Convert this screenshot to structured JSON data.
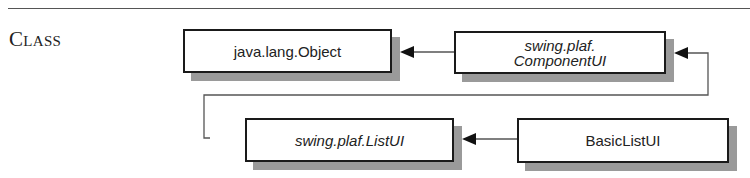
{
  "section": {
    "label": "Class"
  },
  "diagram": {
    "nodes": [
      {
        "id": "object",
        "label": "java.lang.Object",
        "abstract": false
      },
      {
        "id": "componentui",
        "label_line1": "swing.plaf.",
        "label_line2": "ComponentUI",
        "abstract": true
      },
      {
        "id": "listui",
        "label": "swing.plaf.ListUI",
        "abstract": true
      },
      {
        "id": "basiclistui",
        "label": "BasicListUI",
        "abstract": false
      }
    ],
    "edges": [
      {
        "from": "componentui",
        "to": "object",
        "type": "extends"
      },
      {
        "from": "listui",
        "to": "componentui",
        "type": "extends"
      },
      {
        "from": "basiclistui",
        "to": "listui",
        "type": "extends"
      }
    ]
  },
  "colors": {
    "border": "#1a1a1a",
    "shadow": "#9a9a9a",
    "line": "#555555"
  }
}
